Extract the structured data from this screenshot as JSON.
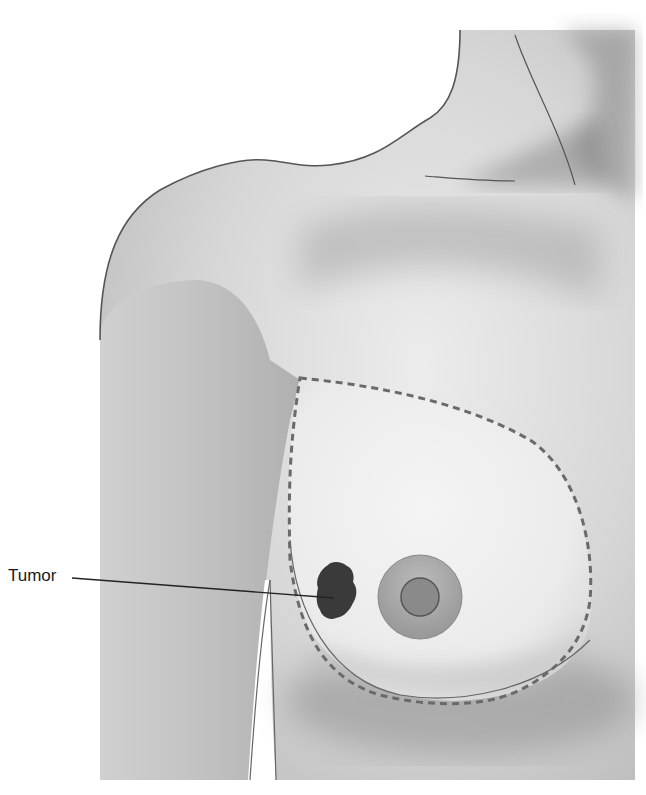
{
  "figure": {
    "labels": [
      {
        "text": "Tumor",
        "target": "tumor"
      }
    ],
    "elements": {
      "breast_outline": "dashed",
      "tumor": "dark irregular mass, lower outer quadrant",
      "nipple_areola": "concentric circles"
    },
    "colors": {
      "skin_light": "#e4e4e4",
      "skin_mid": "#c8c8c8",
      "skin_shadow": "#9c9c9c",
      "outline": "#555555",
      "dash": "#6a6a6a",
      "tumor": "#3a3a3a",
      "areola": "#a8a8a8",
      "nipple": "#8a8a8a"
    }
  }
}
